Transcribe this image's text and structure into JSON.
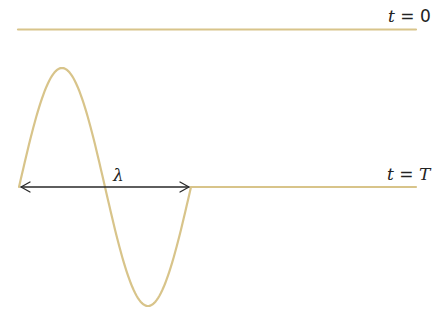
{
  "diagram": {
    "colors": {
      "string": "#d8c48a",
      "arrow": "#2a2a2a",
      "text": "#222222"
    },
    "top_state": {
      "label_var": "t",
      "label_eq": " = ",
      "label_val": "0",
      "shape": "flat string, undisturbed"
    },
    "bottom_state": {
      "label_var": "t",
      "label_eq": " = ",
      "label_val": "T",
      "shape": "one full sine cycle (crest then trough) followed by flat string"
    },
    "wavelength": {
      "symbol": "λ",
      "arrow": "double-headed, spans one full cycle"
    }
  }
}
